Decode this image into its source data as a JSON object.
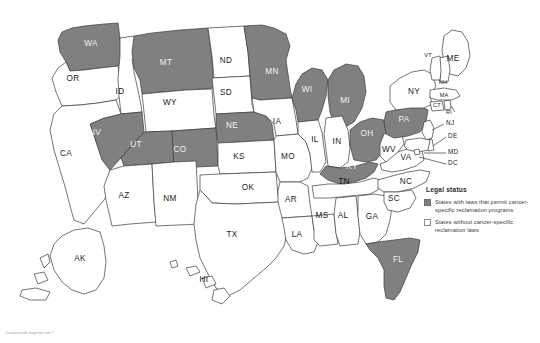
{
  "map": {
    "title": "United States choropleth map",
    "colors": {
      "shaded": "#808080",
      "unshaded": "#ffffff",
      "border": "#3b3b3b",
      "background": "#ffffff"
    },
    "states": [
      {
        "code": "WA",
        "shaded": true,
        "x": 91,
        "y": 44
      },
      {
        "code": "OR",
        "shaded": false,
        "x": 73,
        "y": 79
      },
      {
        "code": "ID",
        "shaded": false,
        "x": 120,
        "y": 92
      },
      {
        "code": "MT",
        "shaded": true,
        "x": 166,
        "y": 63
      },
      {
        "code": "ND",
        "shaded": false,
        "x": 226,
        "y": 61
      },
      {
        "code": "SD",
        "shaded": false,
        "x": 226,
        "y": 93
      },
      {
        "code": "WY",
        "shaded": false,
        "x": 170,
        "y": 103
      },
      {
        "code": "NV",
        "shaded": true,
        "x": 95,
        "y": 133
      },
      {
        "code": "UT",
        "shaded": true,
        "x": 136,
        "y": 145
      },
      {
        "code": "CO",
        "shaded": true,
        "x": 180,
        "y": 150
      },
      {
        "code": "CA",
        "shaded": false,
        "x": 66,
        "y": 154
      },
      {
        "code": "AZ",
        "shaded": false,
        "x": 124,
        "y": 196
      },
      {
        "code": "NM",
        "shaded": false,
        "x": 170,
        "y": 199
      },
      {
        "code": "NE",
        "shaded": true,
        "x": 232,
        "y": 126
      },
      {
        "code": "KS",
        "shaded": false,
        "x": 239,
        "y": 157
      },
      {
        "code": "OK",
        "shaded": false,
        "x": 248,
        "y": 188
      },
      {
        "code": "TX",
        "shaded": false,
        "x": 232,
        "y": 235
      },
      {
        "code": "MN",
        "shaded": true,
        "x": 272,
        "y": 72
      },
      {
        "code": "IA",
        "shaded": false,
        "x": 277,
        "y": 122
      },
      {
        "code": "MO",
        "shaded": false,
        "x": 288,
        "y": 157
      },
      {
        "code": "AR",
        "shaded": false,
        "x": 291,
        "y": 200
      },
      {
        "code": "LA",
        "shaded": false,
        "x": 297,
        "y": 235
      },
      {
        "code": "WI",
        "shaded": true,
        "x": 307,
        "y": 90
      },
      {
        "code": "IL",
        "shaded": false,
        "x": 315,
        "y": 140
      },
      {
        "code": "MS",
        "shaded": false,
        "x": 322,
        "y": 216
      },
      {
        "code": "MI",
        "shaded": true,
        "x": 345,
        "y": 101
      },
      {
        "code": "IN",
        "shaded": false,
        "x": 337,
        "y": 142
      },
      {
        "code": "KY",
        "shaded": true,
        "x": 352,
        "y": 167
      },
      {
        "code": "TN",
        "shaded": false,
        "x": 344,
        "y": 182
      },
      {
        "code": "AL",
        "shaded": false,
        "x": 343,
        "y": 216
      },
      {
        "code": "OH",
        "shaded": true,
        "x": 367,
        "y": 134
      },
      {
        "code": "GA",
        "shaded": false,
        "x": 372,
        "y": 217
      },
      {
        "code": "FL",
        "shaded": true,
        "x": 398,
        "y": 260
      },
      {
        "code": "WV",
        "shaded": false,
        "x": 389,
        "y": 150
      },
      {
        "code": "VA",
        "shaded": false,
        "x": 406,
        "y": 158
      },
      {
        "code": "NC",
        "shaded": false,
        "x": 406,
        "y": 182
      },
      {
        "code": "SC",
        "shaded": false,
        "x": 394,
        "y": 199
      },
      {
        "code": "PA",
        "shaded": true,
        "x": 404,
        "y": 120
      },
      {
        "code": "NY",
        "shaded": false,
        "x": 414,
        "y": 92
      },
      {
        "code": "ME",
        "shaded": false,
        "x": 453,
        "y": 59
      },
      {
        "code": "AK",
        "shaded": false,
        "x": 80,
        "y": 259
      },
      {
        "code": "HI",
        "shaded": false,
        "x": 204,
        "y": 280
      }
    ],
    "small_labels": [
      {
        "code": "VT",
        "x": 428,
        "y": 56
      },
      {
        "code": "NH",
        "x": 443,
        "y": 83
      },
      {
        "code": "MA",
        "x": 444,
        "y": 96
      },
      {
        "code": "CT",
        "x": 437,
        "y": 106
      },
      {
        "code": "RI",
        "x": 449,
        "y": 113
      }
    ],
    "leader_labels": [
      {
        "code": "NJ",
        "x": 446,
        "y": 123
      },
      {
        "code": "DE",
        "x": 448,
        "y": 136
      },
      {
        "code": "MD",
        "x": 448,
        "y": 152
      },
      {
        "code": "DC",
        "x": 448,
        "y": 163
      }
    ]
  },
  "legend": {
    "title": "Legal status",
    "items": [
      {
        "swatch": "filled",
        "text": "States with laws that permit cancer-specific reclamation programs"
      },
      {
        "swatch": "empty",
        "text": "States without cancer-specific reclamation laws"
      }
    ]
  },
  "credit": "Created with mapchart.net ©"
}
